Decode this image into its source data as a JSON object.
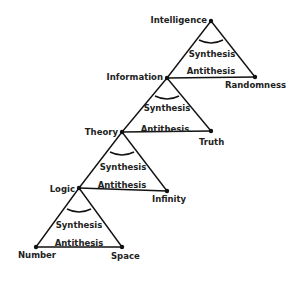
{
  "diagram": {
    "type": "stacked-dialectic-triangles",
    "nodes": {
      "intelligence": "Intelligence",
      "information": "Information",
      "randomness": "Randomness",
      "theory": "Theory",
      "truth": "Truth",
      "logic": "Logic",
      "infinity": "Infinity",
      "number": "Number",
      "space": "Space"
    },
    "triangles": [
      {
        "apex": "Intelligence",
        "left": "Information",
        "right": "Randomness",
        "synthesis": "Synthesis",
        "antithesis": "Antithesis"
      },
      {
        "apex": "Information",
        "left": "Theory",
        "right": "Truth",
        "synthesis": "Synthesis",
        "antithesis": "Antithesis"
      },
      {
        "apex": "Theory",
        "left": "Logic",
        "right": "Infinity",
        "synthesis": "Synthesis",
        "antithesis": "Antithesis"
      },
      {
        "apex": "Logic",
        "left": "Number",
        "right": "Space",
        "synthesis": "Synthesis",
        "antithesis": "Antithesis"
      }
    ],
    "line_color": "#111111"
  }
}
